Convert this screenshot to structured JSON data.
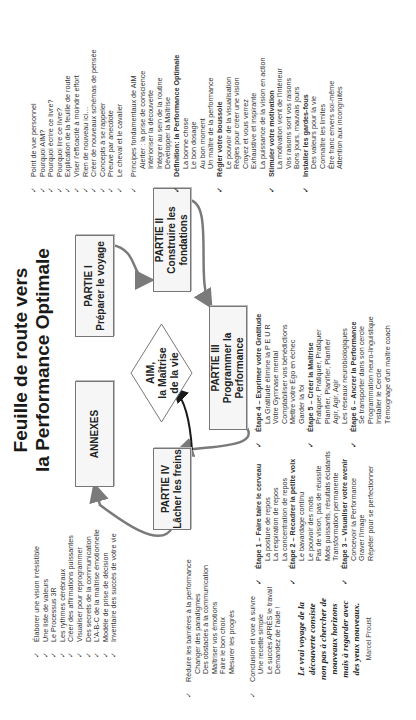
{
  "title": {
    "line1": "Feuille de route vers",
    "line2": "la Performance Optimale"
  },
  "check_glyph": "✓",
  "diagram": {
    "center": {
      "line1": "AIM,",
      "line2": "la Maîtrise",
      "line3": "de la vie"
    },
    "boxes": [
      {
        "id": "partie-1",
        "line1": "PARTIE I",
        "line2": "Préparer le voyage"
      },
      {
        "id": "partie-2",
        "line1": "PARTIE II",
        "line2": "Construire les",
        "line3": "fondations"
      },
      {
        "id": "partie-3",
        "line1": "PARTIE III",
        "line2": "Programmer la",
        "line3": "Performance"
      },
      {
        "id": "partie-4",
        "line1": "PARTIE IV",
        "line2": "Lâcher les freins"
      },
      {
        "id": "annexes",
        "line1": "ANNEXES"
      }
    ]
  },
  "lists": {
    "partie1": [
      "Point de vue personnel",
      "Pourquoi AIM?",
      "Pourquoi écrire ce livre?",
      "Pourquoi lire ce livre?",
      "Explication de la feuille de route",
      "Viser l'efficacité à moindre effort",
      "Rien de nouveau ici…",
      "Créer de nouveaux schémas de pensée",
      "Concepts à se rappeler",
      "Preuve par anecdote",
      "Le cheval et le cavalier"
    ],
    "annexes": [
      "Élaborer une vision irrésistible",
      "Une liste de valeurs",
      "Le Processus 3R",
      "Les rythmes cérébraux",
      "Créer des affirmations puissantes",
      "Visualiser pour reprogrammer",
      "Des secrets de la communication",
      "L'A-B-C de la maîtrise émotionnelle",
      "Modèle de prise de décision",
      "Inventaire des succès de votre vie"
    ],
    "partie2": [
      {
        "head": "Principes fondamentaux de AIM",
        "bold": false,
        "items": [
          "Alerter : la prise de conscience",
          "Intérioriser la découverte",
          "Intégrer au sein de la routine",
          "Développer la Maîtrise"
        ]
      },
      {
        "head": "Définition: la Performance Optimale",
        "bold": true,
        "items": [
          "La bonne chose",
          "Le bon dosage",
          "Au bon moment",
          "Un maître de la performance"
        ]
      },
      {
        "head": "Régler votre boussole",
        "bold": true,
        "items": [
          "Le pouvoir de la visualisation",
          "Règles pour créer une vision",
          "Croyez et vous verrez",
          "Exhaustive et inspirante",
          "La puissance de la vision en action"
        ]
      },
      {
        "head": "Stimuler votre motivation",
        "bold": true,
        "items": [
          "La motivation vient de l'intérieur",
          "Vos raisons sont vos raisons",
          "Bons jours, mauvais jours"
        ]
      },
      {
        "head": "Installer les gardes-fous",
        "bold": true,
        "items": [
          "Des valeurs pour la vie",
          "Connaître les limites",
          "Être franc envers soi-même",
          "Attention aux incongruités"
        ]
      }
    ],
    "partie3a": [
      {
        "head": "Étape 1 – Faire taire le cerveau",
        "items": [
          "La posture de repos",
          "La respiration de repos",
          "La concentration de repos"
        ]
      },
      {
        "head": "Étape 2 – Recadrer la petite voix",
        "items": [
          "Le bavardage continu",
          "Le pouvoir des mots",
          "Pas de vision, pas de réussite",
          "Mots puissants, résultats éclatants",
          "Transformation permanente"
        ]
      },
      {
        "head": "Étape 3 – Visualiser votre avenir",
        "items": [
          "Concevoir la Performance",
          "Graver l'image",
          "Répéter pour se perfectionner"
        ]
      }
    ],
    "partie3b": [
      {
        "head": "Étape 4 – Exprimer votre Gratitude",
        "items": [
          "La Gratitude élimine la P E U R",
          "Votre Gymnase mental",
          "Comptabiliser vos bénédictions",
          "Mettre votre Ego en échec",
          "Garder la foi"
        ]
      },
      {
        "head": "Étape 5 – Créer la Maîtrise",
        "items": [
          "Pratiquer, Pratiquer, Pratiquer",
          "Planifier, Planifier, Planifier",
          "Agir, Agir, Agir",
          "Les réseaux neurobiologiques"
        ]
      },
      {
        "head": "Étape 6 – Ancrer la Performance",
        "items": [
          "Se transporter dans son cercle",
          "Programmation neuro-linguistique",
          "Installer le Cercle",
          "Témoignage d'un maître coach"
        ]
      }
    ],
    "partie4": [
      {
        "head": "Réduire les barrières à la performance",
        "items": [
          "Changer des paradigmes",
          "Des obstacles à la communication",
          "Maîtriser vos émotions",
          "Faire le bon choix",
          "Mesurer les progrès"
        ]
      },
      {
        "head": "Conclusion et voie à suivre",
        "items": [
          "Une recette simple",
          "Le succès APRÈS le travail",
          "Demandez de l'aide !"
        ]
      }
    ]
  },
  "quote": {
    "lines": [
      "Le vrai voyage de la",
      "découverte consiste",
      "non pas à chercher de",
      "nouveaux horizons",
      "mais à regarder avec",
      "des yeux nouveaux."
    ],
    "author": "Marcel Proust"
  },
  "colors": {
    "arrow_gray": "#7a7a7a",
    "arrow_dark": "#1a1a1a",
    "box_border": "#777777",
    "box_fill": "#f6f6f6"
  }
}
